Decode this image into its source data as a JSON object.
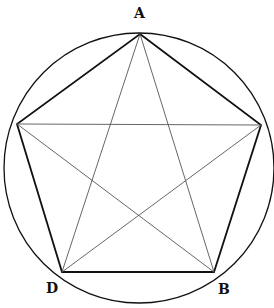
{
  "diagram": {
    "labels": {
      "top": "A",
      "bottom_right": "B",
      "bottom_left": "D"
    },
    "vertices": {
      "A": [
        140,
        34
      ],
      "right": [
        261,
        125
      ],
      "B": [
        214,
        272
      ],
      "D": [
        62,
        272
      ],
      "left": [
        17,
        124
      ]
    },
    "circle": {
      "cx": 139,
      "cy": 168,
      "r": 135
    },
    "colors": {
      "stroke": "#111111",
      "diagonal": "#555555",
      "background": "#ffffff"
    }
  }
}
